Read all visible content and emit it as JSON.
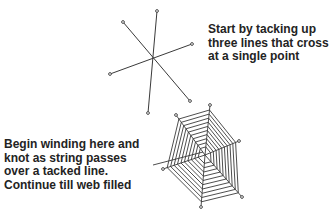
{
  "diagram": {
    "step1": {
      "caption_lines": [
        "Start by tacking up",
        "three lines that cross",
        "at a single point"
      ],
      "center": [
        153,
        59
      ],
      "line_endpoints": [
        [
          [
            157,
            11
          ],
          [
            148,
            113
          ]
        ],
        [
          [
            123,
            22
          ],
          [
            190,
            101
          ]
        ],
        [
          [
            192,
            44
          ],
          [
            110,
            74
          ]
        ]
      ]
    },
    "step2": {
      "caption_lines": [
        "Begin winding here and",
        "knot as string passes",
        "over a tacked line.",
        "Continue till web filled"
      ],
      "center": [
        205,
        155
      ],
      "spoke_ends": [
        [
          210,
          105
        ],
        [
          239,
          141
        ],
        [
          242,
          197
        ],
        [
          201,
          207
        ],
        [
          163,
          169
        ],
        [
          176,
          115
        ]
      ],
      "rings": 10,
      "leader_line": [
        [
          153,
          165
        ],
        [
          203,
          152
        ]
      ]
    },
    "colors": {
      "line": "#3a3a3a",
      "text": "#232323",
      "background": "#ffffff"
    }
  }
}
